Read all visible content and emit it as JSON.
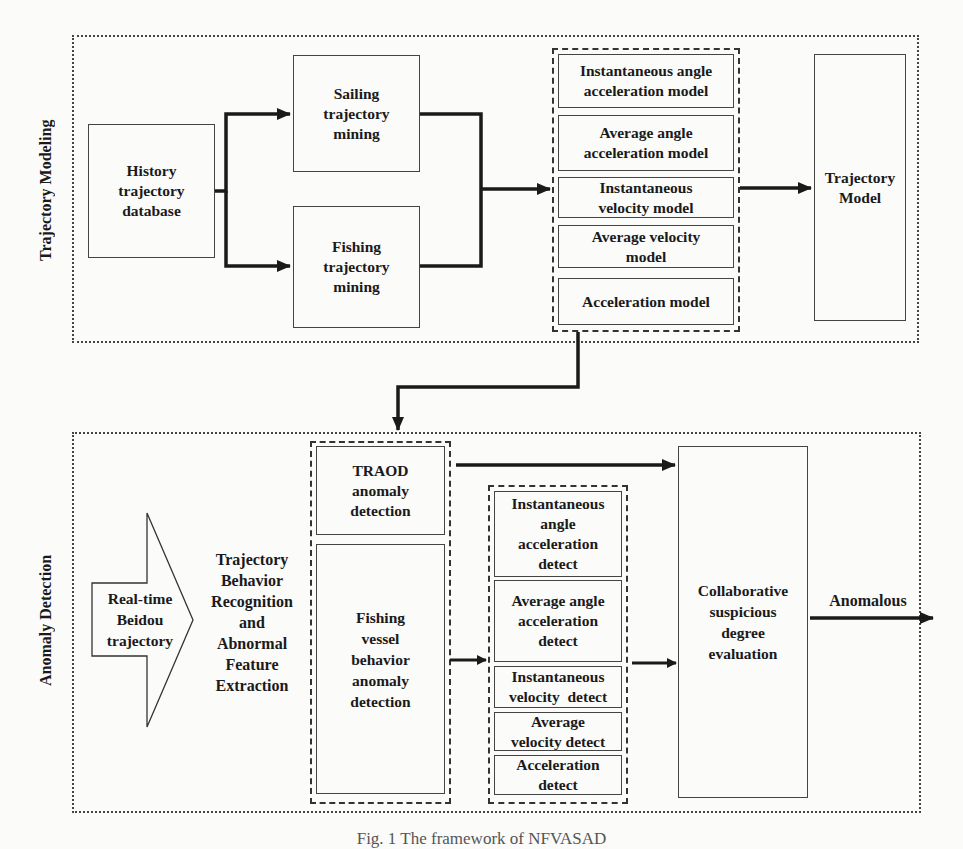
{
  "diagram": {
    "type": "flowchart",
    "sections": {
      "modeling": {
        "label": "Trajectory Modeling",
        "history_db": "History\ntrajectory\ndatabase",
        "sailing_mining": "Sailing\ntrajectory\nmining",
        "fishing_mining": "Fishing\ntrajectory\nmining",
        "models": [
          "Instantaneous angle\nacceleration model",
          "Average angle\nacceleration model",
          "Instantaneous\nvelocity model",
          "Average velocity\nmodel",
          "Acceleration model"
        ],
        "output": "Trajectory\nModel"
      },
      "detection": {
        "label": "Anomaly Detection",
        "input_arrow": "Real-time\nBeidou\ntrajectory",
        "recognition": "Trajectory\nBehavior\nRecognition\nand\nAbnormal\nFeature\nExtraction",
        "traod": "TRAOD\nanomaly\ndetection",
        "fishing_vessel": "Fishing\nvessel\nbehavior\nanomaly\ndetection",
        "detects": [
          "Instantaneous\nangle\nacceleration\ndetect",
          "Average angle\nacceleration\ndetect",
          "Instantaneous\nvelocity  detect",
          "Average\nvelocity detect",
          "Acceleration\ndetect"
        ],
        "evaluation": "Collaborative\nsuspicious\ndegree\nevaluation",
        "result_label": "Anomalous"
      }
    },
    "edges": [
      {
        "from": "History trajectory database",
        "to": "Sailing trajectory mining"
      },
      {
        "from": "History trajectory database",
        "to": "Fishing trajectory mining"
      },
      {
        "from": "Sailing trajectory mining",
        "to": "model group"
      },
      {
        "from": "Fishing trajectory mining",
        "to": "model group"
      },
      {
        "from": "model group",
        "to": "Trajectory Model"
      },
      {
        "from": "model group",
        "to": "detection group"
      },
      {
        "from": "TRAOD anomaly detection",
        "to": "Collaborative suspicious degree evaluation"
      },
      {
        "from": "Fishing vessel behavior anomaly detection",
        "to": "detect group"
      },
      {
        "from": "detect group",
        "to": "Collaborative suspicious degree evaluation"
      },
      {
        "from": "Collaborative suspicious degree evaluation",
        "to": "Anomalous"
      }
    ]
  },
  "caption": "Fig. 1   The framework of NFVASAD"
}
